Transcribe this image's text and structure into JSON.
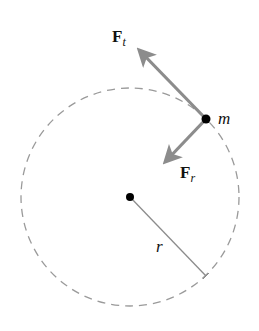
{
  "diagram": {
    "circle": {
      "cx": 130,
      "cy": 197,
      "r": 109,
      "stroke": "#9a9a9a",
      "dash": "8 6"
    },
    "center_point": {
      "x": 130,
      "y": 197
    },
    "mass": {
      "x": 206,
      "y": 119,
      "label": "m"
    },
    "radius": {
      "label": "r",
      "end": {
        "x": 206,
        "y": 276
      }
    },
    "forces": [
      {
        "id": "tangential",
        "label_main": "F",
        "label_sub": "t",
        "tip": {
          "x": 136,
          "y": 47
        }
      },
      {
        "id": "radial",
        "label_main": "F",
        "label_sub": "r",
        "tip": {
          "x": 161,
          "y": 166
        }
      }
    ],
    "colors": {
      "arrow": "#8c8c8c",
      "point": "#000000",
      "radius_line": "#8c8c8c",
      "text": "#111111"
    }
  }
}
